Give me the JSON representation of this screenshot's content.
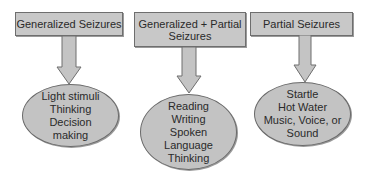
{
  "colors": {
    "box_fill": "#c8c8c8",
    "ellipse_fill": "#c3c3c3",
    "border": "#6e6e6e",
    "text": "#2a2a2a"
  },
  "columns": [
    {
      "category": "Generalized Seizures",
      "category_lines": [
        "Generalized Seizures"
      ],
      "triggers": [
        "Light stimuli",
        "Thinking",
        "Decision",
        "making"
      ]
    },
    {
      "category": "Generalized + Partial Seizures",
      "category_lines": [
        "Generalized + Partial",
        "Seizures"
      ],
      "triggers": [
        "Reading",
        "Writing",
        "Spoken",
        "Language",
        "Thinking"
      ]
    },
    {
      "category": "Partial Seizures",
      "category_lines": [
        "Partial Seizures"
      ],
      "triggers": [
        "Startle",
        "Hot Water",
        "Music, Voice, or",
        "Sound"
      ]
    }
  ]
}
